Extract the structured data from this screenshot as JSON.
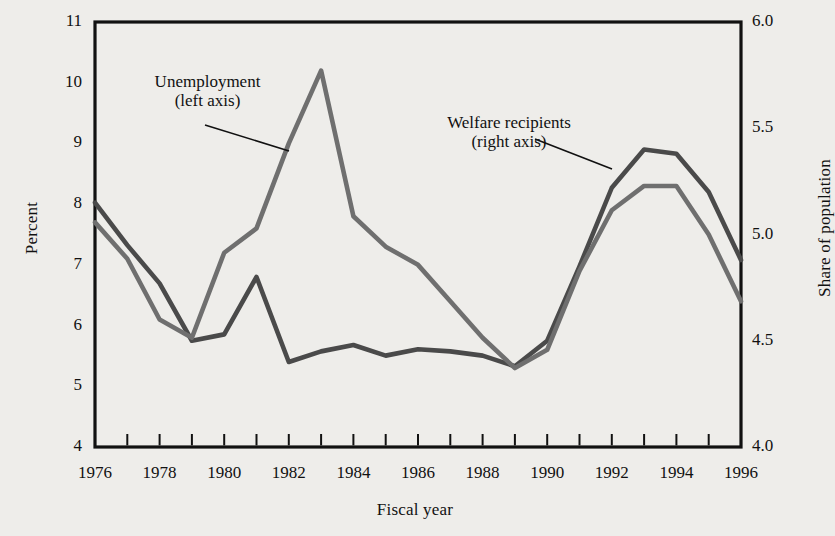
{
  "chart_data": {
    "type": "line",
    "title": "",
    "xlabel": "Fiscal year",
    "ylabel": "Percent",
    "ylabel_right": "Share of population",
    "x": [
      1976,
      1977,
      1978,
      1979,
      1980,
      1981,
      1982,
      1983,
      1984,
      1985,
      1986,
      1987,
      1988,
      1989,
      1990,
      1991,
      1992,
      1993,
      1994,
      1995,
      1996
    ],
    "xlim": [
      1976,
      1996
    ],
    "xtick_labels": [
      "1976",
      "1978",
      "1980",
      "1982",
      "1984",
      "1986",
      "1988",
      "1990",
      "1992",
      "1994",
      "1996"
    ],
    "xtick_values": [
      1976,
      1978,
      1980,
      1982,
      1984,
      1986,
      1988,
      1990,
      1992,
      1994,
      1996
    ],
    "ylim": [
      4,
      11
    ],
    "ytick_labels": [
      "4",
      "5",
      "6",
      "7",
      "8",
      "9",
      "10",
      "11"
    ],
    "ytick_values": [
      4,
      5,
      6,
      7,
      8,
      9,
      10,
      11
    ],
    "ylim_right": [
      4.0,
      6.0
    ],
    "ytick_labels_right": [
      "4.0",
      "4.5",
      "5.0",
      "5.5",
      "6.0"
    ],
    "ytick_values_right": [
      4.0,
      4.5,
      5.0,
      5.5,
      6.0
    ],
    "grid": false,
    "legend_position": "inline-annotations",
    "series": [
      {
        "name": "Unemployment",
        "axis": "left",
        "color": "#6f6f6f",
        "values": [
          7.7,
          7.1,
          6.1,
          5.8,
          7.2,
          7.6,
          9.0,
          10.2,
          7.8,
          7.3,
          7.0,
          6.4,
          5.8,
          5.3,
          5.6,
          6.9,
          7.9,
          8.3,
          8.3,
          7.5,
          6.4
        ]
      },
      {
        "name": "Welfare recipients",
        "axis": "right",
        "color": "#4a4a4a",
        "values": [
          5.15,
          4.95,
          4.77,
          4.5,
          4.53,
          4.8,
          4.4,
          4.45,
          4.48,
          4.43,
          4.46,
          4.45,
          4.43,
          4.38,
          4.5,
          4.85,
          5.22,
          5.4,
          5.38,
          5.2,
          4.88
        ]
      }
    ],
    "annotations": [
      {
        "name": "unemployment-label",
        "line1": "Unemployment",
        "line2": "(left axis)",
        "leader_from": [
          205,
          125
        ],
        "leader_to": [
          289,
          151
        ]
      },
      {
        "name": "welfare-label",
        "line1": "Welfare recipients",
        "line2": "(right axis)",
        "leader_from": [
          535,
          139
        ],
        "leader_to": [
          612,
          169
        ]
      }
    ]
  }
}
